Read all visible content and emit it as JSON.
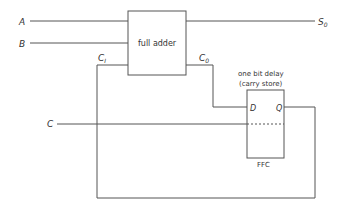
{
  "diagram": {
    "inputs": {
      "a": "A",
      "b": "B",
      "clock": "C"
    },
    "output": {
      "sum": "S",
      "sum_sub": "0"
    },
    "full_adder": {
      "label": "full adder",
      "carry_in": "C",
      "carry_in_sub": "I",
      "carry_out": "C",
      "carry_out_sub": "0"
    },
    "flip_flop": {
      "caption_line1": "one bit delay",
      "caption_line2": "(carry store)",
      "d_label": "D",
      "q_label": "Q",
      "name": "FFC"
    }
  }
}
